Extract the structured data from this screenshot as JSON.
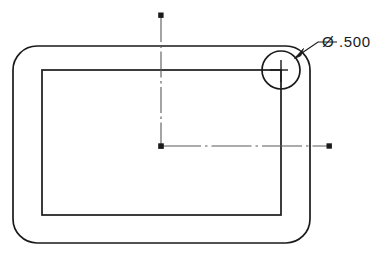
{
  "drawing": {
    "title": "Rounded rectangle plate with corner radius callout",
    "background_color": "#ffffff",
    "line_color": "#1a1a1a",
    "centerline_color": "#555555",
    "annotations": {
      "corner_radius_callout": {
        "label": "Ø .500",
        "symbol": "diameter-symbol",
        "value": ".500",
        "units": "inch",
        "text_x": 322,
        "text_y": 47
      }
    },
    "geometry": {
      "outer_plate": {
        "name": "outer-rounded-rectangle",
        "x": 13,
        "y": 46,
        "width": 297,
        "height": 197,
        "corner_radius": 24
      },
      "inner_pocket": {
        "name": "inner-rectangle",
        "x": 42,
        "y": 70,
        "width": 239,
        "height": 145,
        "corner_radius": 0
      },
      "corner_circle": {
        "name": "corner-radius-circle",
        "center_x": 281,
        "center_y": 70,
        "radius": 19,
        "diameter": ".500"
      },
      "leader_line": {
        "name": "leader-line",
        "from_x": 295.5,
        "from_y": 56.5,
        "elbow_x": 318,
        "elbow_y": 42,
        "to_x": 336,
        "to_y": 42
      },
      "datum_origin": {
        "name": "datum-origin-point",
        "x": 161,
        "y": 146
      },
      "vertical_centerline": {
        "name": "vertical-centerline",
        "x": 161,
        "y_top": 14,
        "y_bottom": 146
      },
      "horizontal_centerline": {
        "name": "horizontal-centerline",
        "y": 146,
        "x_left": 161,
        "x_right": 329
      }
    }
  }
}
